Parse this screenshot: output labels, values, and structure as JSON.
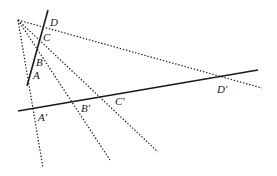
{
  "diagram": {
    "center": {
      "x": 18,
      "y": 20
    },
    "line1": {
      "from": [
        48,
        10
      ],
      "to": [
        27,
        86
      ]
    },
    "line2": {
      "from": [
        18,
        111
      ],
      "to": [
        258,
        70
      ]
    },
    "points_line1": [
      {
        "label": "A",
        "x": 32,
        "y": 68,
        "lx": 33,
        "ly": 79
      },
      {
        "label": "B",
        "x": 37,
        "y": 50,
        "lx": 37,
        "ly": 66
      },
      {
        "label": "C",
        "x": 42,
        "y": 33,
        "lx": 43,
        "ly": 41
      },
      {
        "label": "D",
        "x": 45,
        "y": 23,
        "lx": 50,
        "ly": 26
      }
    ],
    "points_line2": [
      {
        "label": "A'",
        "x": 34,
        "y": 108,
        "lx": 38,
        "ly": 120
      },
      {
        "label": "B'",
        "x": 73,
        "y": 102,
        "lx": 80,
        "ly": 112
      },
      {
        "label": "C'",
        "x": 99,
        "y": 97,
        "lx": 114,
        "ly": 105
      },
      {
        "label": "D'",
        "x": 220,
        "y": 78,
        "lx": 217,
        "ly": 92
      }
    ],
    "rays": [
      {
        "name": "ray-a",
        "to": [
          43,
          168
        ]
      },
      {
        "name": "ray-b",
        "to": [
          110,
          160
        ]
      },
      {
        "name": "ray-c",
        "to": [
          158,
          152
        ]
      },
      {
        "name": "ray-d",
        "to": [
          262,
          88
        ]
      }
    ],
    "labels": {
      "A": "A",
      "B": "B",
      "C": "C",
      "D": "D",
      "A_prime": "A'",
      "B_prime": "B'",
      "C_prime": "C'",
      "D_prime": "D'"
    }
  }
}
